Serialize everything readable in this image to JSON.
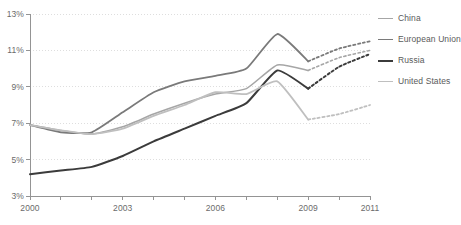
{
  "chart_data": {
    "type": "line",
    "title": "",
    "subtitle": "",
    "xlabel": "",
    "ylabel": "",
    "xlim": [
      2000,
      2011
    ],
    "ylim": [
      3,
      13
    ],
    "y_tick_labels": [
      "3%",
      "5%",
      "7%",
      "9%",
      "11%",
      "13%"
    ],
    "y_tick_values": [
      3,
      5,
      7,
      9,
      11,
      13
    ],
    "x_tick_labels": [
      "2000",
      "2003",
      "2006",
      "2009",
      "2011"
    ],
    "x_tick_values": [
      2000,
      2003,
      2006,
      2009,
      2011
    ],
    "x_minor_ticks": [
      2001,
      2002,
      2004,
      2005,
      2007,
      2008,
      2010
    ],
    "grid": "dotted-horizontal",
    "legend_position": "right",
    "forecast_start": 2009,
    "forecast_style": "dotted",
    "x": [
      2000,
      2001,
      2002,
      2003,
      2004,
      2005,
      2006,
      2007,
      2008,
      2009,
      2010,
      2011
    ],
    "series": [
      {
        "name": "China",
        "color": "#a6a6a6",
        "width": 1.6,
        "values": [
          6.9,
          6.6,
          6.4,
          6.8,
          7.5,
          8.1,
          8.6,
          8.9,
          10.2,
          9.9,
          10.6,
          11.0
        ]
      },
      {
        "name": "European Union",
        "color": "#7a7a7a",
        "width": 1.8,
        "values": [
          6.9,
          6.5,
          6.5,
          7.6,
          8.7,
          9.3,
          9.6,
          10.0,
          11.9,
          10.4,
          11.1,
          11.5
        ]
      },
      {
        "name": "Russia",
        "color": "#3b3b3b",
        "width": 2.0,
        "values": [
          4.2,
          4.4,
          4.6,
          5.2,
          6.0,
          6.7,
          7.4,
          8.1,
          9.9,
          8.9,
          10.1,
          10.8
        ]
      },
      {
        "name": "United States",
        "color": "#bfbfbf",
        "width": 1.8,
        "values": [
          6.9,
          6.6,
          6.4,
          6.7,
          7.4,
          8.0,
          8.7,
          8.6,
          9.3,
          7.2,
          7.5,
          8.0
        ]
      }
    ]
  },
  "legend": {
    "items": [
      {
        "label": "China",
        "color": "#a6a6a6",
        "width": 1.6
      },
      {
        "label": "European Union",
        "color": "#7a7a7a",
        "width": 1.8
      },
      {
        "label": "Russia",
        "color": "#3b3b3b",
        "width": 2.2
      },
      {
        "label": "United States",
        "color": "#bfbfbf",
        "width": 1.8
      }
    ]
  },
  "axes": {
    "y_labels": [
      "13%",
      "11%",
      "9%",
      "7%",
      "5%",
      "3%"
    ],
    "x_labels": [
      "2000",
      "2003",
      "2006",
      "2009",
      "2011"
    ]
  }
}
